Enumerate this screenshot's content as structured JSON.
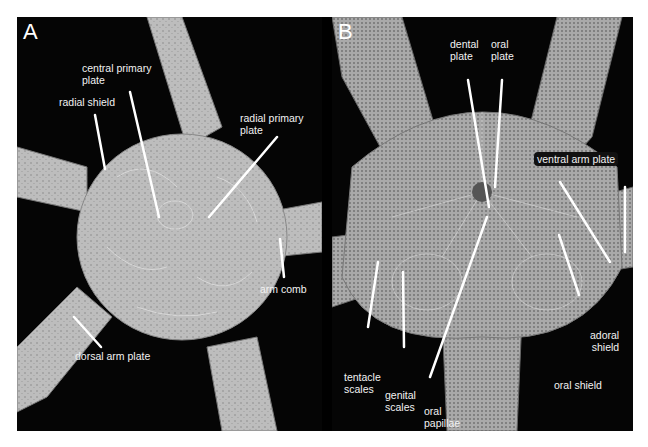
{
  "figure": {
    "panels": [
      {
        "letter": "A",
        "view": "aboral (dorsal)",
        "labels": {
          "central_primary_plate": "central primary\nplate",
          "radial_shield": "radial shield",
          "radial_primary_plate": "radial primary\nplate",
          "arm_comb": "arm comb",
          "dorsal_arm_plate": "dorsal arm plate"
        }
      },
      {
        "letter": "B",
        "view": "oral (ventral)",
        "labels": {
          "dental_plate": "dental\nplate",
          "oral_plate": "oral\nplate",
          "ventral_arm_plate": "ventral arm plate",
          "adoral_shield": "adoral\nshield",
          "oral_shield": "oral shield",
          "tentacle_scales": "tentacle\nscales",
          "genital_scales": "genital\nscales",
          "oral_papillae": "oral\npapillae"
        }
      }
    ],
    "colors": {
      "background": "#000000",
      "specimen": "#c8c8c8",
      "label_text": "#f2f2f2",
      "leader_line": "#ffffff"
    }
  }
}
